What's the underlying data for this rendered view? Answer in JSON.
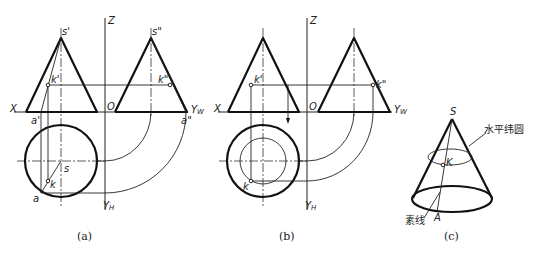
{
  "figure": {
    "panels": [
      {
        "id": "a",
        "caption": "(a)",
        "labels": {
          "z": "Z",
          "x": "X",
          "o": "O",
          "yw": "Y",
          "yw_sub": "W",
          "yh": "Y",
          "yh_sub": "H",
          "s_front": "s'",
          "s_side": "s\"",
          "k_front": "k'",
          "k_side": "k\"",
          "a_front": "a'",
          "a_side": "a\"",
          "s_top": "s",
          "k_top": "k",
          "a_top": "a"
        }
      },
      {
        "id": "b",
        "caption": "(b)",
        "labels": {
          "z": "Z",
          "x": "X",
          "o": "O",
          "yw": "Y",
          "yw_sub": "W",
          "yh": "Y",
          "yh_sub": "H",
          "k_front": "k'",
          "k_side": "k\"",
          "k_top": "k"
        }
      },
      {
        "id": "c",
        "caption": "(c)",
        "labels": {
          "apex": "S",
          "point_k": "K",
          "point_a": "A",
          "latitude_circle": "水平纬圆",
          "generatrix": "素线"
        }
      }
    ]
  }
}
